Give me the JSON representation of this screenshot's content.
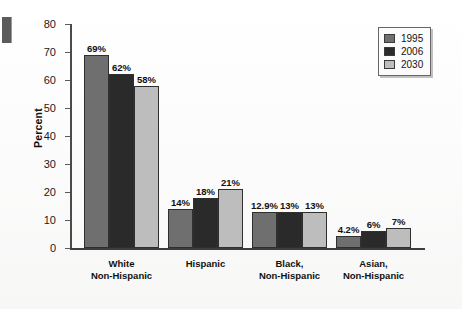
{
  "chart_data": {
    "type": "bar",
    "title": "",
    "subtitle": "",
    "xlabel": "",
    "ylabel": "Percent",
    "ylim": [
      0,
      80
    ],
    "yticks": [
      0,
      10,
      20,
      30,
      40,
      50,
      60,
      70,
      80
    ],
    "ytick_labels": [
      "0",
      "10",
      "20",
      "30",
      "40",
      "50",
      "60",
      "70",
      "80"
    ],
    "grid": false,
    "legend_position": "top-right",
    "categories": [
      "White\nNon-Hispanic",
      "Hispanic",
      "Black,\nNon-Hispanic",
      "Asian,\nNon-Hispanic"
    ],
    "category_lines": [
      [
        "White",
        "Non-Hispanic"
      ],
      [
        "Hispanic",
        ""
      ],
      [
        "Black,",
        "Non-Hispanic"
      ],
      [
        "Asian,",
        "Non-Hispanic"
      ]
    ],
    "series": [
      {
        "name": "1995",
        "color": "#6f6f6f",
        "values": [
          69,
          14,
          12.9,
          4.2
        ],
        "data_labels": [
          "69%",
          "14%",
          "12.9%",
          "4.2%"
        ]
      },
      {
        "name": "2006",
        "color": "#2a2a2a",
        "values": [
          62,
          18,
          13,
          6
        ],
        "data_labels": [
          "62%",
          "18%",
          "13%",
          "6%"
        ]
      },
      {
        "name": "2030",
        "color": "#bdbdbd",
        "values": [
          58,
          21,
          13,
          7
        ],
        "data_labels": [
          "58%",
          "21%",
          "13%",
          "7%"
        ]
      }
    ]
  },
  "legend": {
    "items": [
      {
        "label": "1995",
        "color": "#6f6f6f"
      },
      {
        "label": "2006",
        "color": "#2a2a2a"
      },
      {
        "label": "2030",
        "color": "#bdbdbd"
      }
    ]
  },
  "axes": {
    "y_title": "Percent"
  }
}
